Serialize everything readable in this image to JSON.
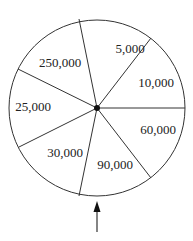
{
  "diagram": {
    "type": "prize-wheel",
    "center": [
      97,
      108
    ],
    "radius": 88,
    "stroke_color": "#333333",
    "segments": [
      {
        "label": "5,000",
        "x": 130,
        "y": 53
      },
      {
        "label": "10,000",
        "x": 156,
        "y": 87
      },
      {
        "label": "60,000",
        "x": 158,
        "y": 134
      },
      {
        "label": "90,000",
        "x": 115,
        "y": 169
      },
      {
        "label": "30,000",
        "x": 65,
        "y": 157
      },
      {
        "label": "25,000",
        "x": 33,
        "y": 111
      },
      {
        "label": "250,000",
        "x": 60,
        "y": 67
      }
    ],
    "dividers": [
      [
        79,
        19
      ],
      [
        151,
        38
      ],
      [
        185,
        108
      ],
      [
        151,
        178
      ],
      [
        79,
        196
      ],
      [
        19,
        147
      ],
      [
        18,
        69
      ]
    ],
    "pointer": {
      "label": "",
      "direction": "up"
    }
  }
}
